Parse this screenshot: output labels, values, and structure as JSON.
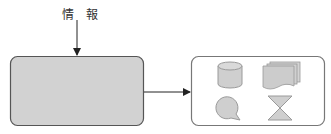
{
  "diagram": {
    "input_label": "情 報",
    "colors": {
      "source_fill": "#d2d2d2",
      "source_stroke": "#555555",
      "target_fill": "#ffffff",
      "target_stroke": "#777777",
      "icon_fill": "#cfcfcf",
      "icon_stroke": "#9a9a9a",
      "arrow": "#222222"
    },
    "nodes": [
      {
        "id": "source-box",
        "shape": "rounded-rect",
        "filled": true
      },
      {
        "id": "target-box",
        "shape": "rounded-rect",
        "filled": false,
        "icons": [
          "database-cylinder-icon",
          "multiple-documents-icon",
          "speech-balloon-icon",
          "hourglass-icon"
        ]
      }
    ],
    "edges": [
      {
        "from": "input-label",
        "to": "source-box",
        "direction": "down"
      },
      {
        "from": "source-box",
        "to": "target-box",
        "direction": "right"
      }
    ]
  }
}
